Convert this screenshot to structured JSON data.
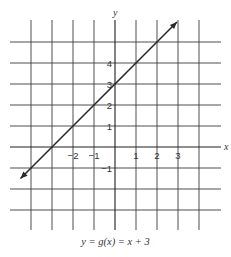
{
  "chart_data": {
    "type": "line",
    "title": "",
    "caption": "y = g(x) = x + 3",
    "xlabel": "x",
    "ylabel": "y",
    "function": "y = x + 3",
    "xlim": [
      -4,
      4
    ],
    "ylim": [
      -3,
      5
    ],
    "grid": true,
    "x_ticks": [
      -2,
      -1,
      1,
      2,
      3
    ],
    "x_tick_labels": [
      "−2",
      "−1",
      "1",
      "2",
      "3"
    ],
    "y_ticks": [
      4,
      3,
      2,
      1,
      -1
    ],
    "y_tick_labels": [
      "4",
      "3",
      "2",
      "1",
      "−1"
    ],
    "series": [
      {
        "name": "g(x) = x + 3",
        "slope": 1,
        "intercept": 3,
        "notes": "Line drawn from the stated equation. Arrowhead endpoints estimated from pixels: upper-right ≈ (2.9, 5.95), consistent with y = x + 3; lower-left ≈ (-4.86, -2.4), which does NOT fit y = x + 3 (expected ≈ -1.86) — likely a pixel-reading error, so not used."
      }
    ],
    "intercepts": {
      "x_intercept": -3,
      "y_intercept": 3
    },
    "arrows": "both ends"
  },
  "labels": {
    "x_axis": "x",
    "y_axis": "y",
    "caption": "y = g(x) = x + 3"
  }
}
